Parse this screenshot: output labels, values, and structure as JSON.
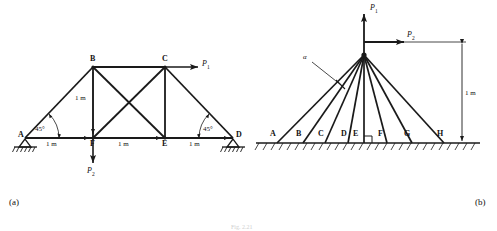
{
  "figure": {
    "panel_a": {
      "tag": "(a)",
      "nodes": [
        {
          "id": "A",
          "label": "A",
          "x": 25,
          "y": 138
        },
        {
          "id": "B",
          "label": "B",
          "x": 93,
          "y": 67
        },
        {
          "id": "C",
          "label": "C",
          "x": 165,
          "y": 67
        },
        {
          "id": "D",
          "label": "D",
          "x": 233,
          "y": 138
        },
        {
          "id": "E",
          "label": "E",
          "x": 165,
          "y": 138
        },
        {
          "id": "F",
          "label": "F",
          "x": 93,
          "y": 138
        }
      ],
      "members": [
        {
          "from": "A",
          "to": "B"
        },
        {
          "from": "B",
          "to": "C"
        },
        {
          "from": "C",
          "to": "D"
        },
        {
          "from": "A",
          "to": "F"
        },
        {
          "from": "F",
          "to": "E"
        },
        {
          "from": "E",
          "to": "D"
        },
        {
          "from": "B",
          "to": "F"
        },
        {
          "from": "C",
          "to": "E"
        },
        {
          "from": "B",
          "to": "E"
        },
        {
          "from": "C",
          "to": "F"
        }
      ],
      "dimensions": [
        {
          "label": "1 m",
          "x": 53,
          "y": 145,
          "orientation": "horizontal",
          "span": "A-F"
        },
        {
          "label": "1 m",
          "x": 125,
          "y": 145,
          "orientation": "horizontal",
          "span": "F-E"
        },
        {
          "label": "1 m",
          "x": 196,
          "y": 145,
          "orientation": "horizontal",
          "span": "E-D"
        },
        {
          "label": "1 m",
          "x": 80,
          "y": 98,
          "orientation": "vertical",
          "span": "B-F"
        }
      ],
      "angles": [
        {
          "label": "45°",
          "x": 41,
          "y": 130,
          "at_node": "A"
        },
        {
          "label": "45°",
          "x": 209,
          "y": 130,
          "at_node": "D"
        }
      ],
      "forces": [
        {
          "id": "P1",
          "label": "P",
          "sub": "1",
          "direction": "right",
          "at_node": "C",
          "label_x": 203,
          "label_y": 61
        },
        {
          "id": "P2",
          "label": "P",
          "sub": "2",
          "direction": "down",
          "at_node": "F",
          "label_x": 88,
          "label_y": 170
        }
      ],
      "supports": [
        {
          "type": "pin-hatched",
          "at_node": "A"
        },
        {
          "type": "pin-hatched",
          "at_node": "D"
        }
      ]
    },
    "panel_b": {
      "tag": "(b)",
      "apex": {
        "x": 364,
        "y": 55
      },
      "ground_y": 143,
      "ground_points": [
        {
          "id": "A",
          "label": "A",
          "x": 277
        },
        {
          "id": "B",
          "label": "B",
          "x": 303
        },
        {
          "id": "C",
          "label": "C",
          "x": 325
        },
        {
          "id": "D",
          "label": "D",
          "x": 348
        },
        {
          "id": "E",
          "label": "E",
          "x": 361
        },
        {
          "id": "F",
          "label": "F",
          "x": 387
        },
        {
          "id": "G",
          "label": "G",
          "x": 412
        },
        {
          "id": "H",
          "label": "H",
          "x": 444
        }
      ],
      "cable_ends_x": [
        277,
        303,
        325,
        348,
        364,
        387,
        412,
        444
      ],
      "angle_marker": {
        "label": "α",
        "x": 305,
        "y": 57
      },
      "right_angle_marker": {
        "x": 364,
        "y": 131
      },
      "forces": [
        {
          "id": "P1",
          "label": "P",
          "sub": "1",
          "direction": "up",
          "label_x": 372,
          "label_y": 8
        },
        {
          "id": "P2",
          "label": "P",
          "sub": "2",
          "direction": "right",
          "label_x": 409,
          "label_y": 35
        }
      ],
      "dimension": {
        "label": "1 m",
        "x": 468,
        "y": 94,
        "orientation": "vertical",
        "from_y": 53,
        "to_y": 143,
        "line_x": 462
      }
    },
    "caption": "Fig. 2.21",
    "colors": {
      "line": "#1a1a1a",
      "background": "#ffffff",
      "caption": "#cfcfcf"
    }
  }
}
